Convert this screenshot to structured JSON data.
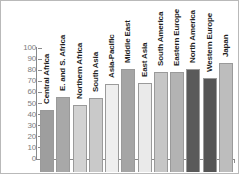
{
  "chart_data": {
    "type": "bar",
    "title": "",
    "subtitle": "",
    "xlabel": "",
    "ylabel": "",
    "ylim": [
      0,
      100
    ],
    "yticks": [
      0,
      10,
      20,
      30,
      40,
      50,
      60,
      70,
      80,
      90,
      100
    ],
    "grid": false,
    "legend": "none",
    "orientation": "vertical",
    "label_rotation": -90,
    "categories": [
      "Central Africa",
      "E. and S. Africa",
      "Northern Africa",
      "South Asia",
      "Asia-Pacific",
      "Middle East",
      "East Asia",
      "South America",
      "Eastern Europe",
      "North America",
      "Western Europe",
      "Japan"
    ],
    "values": [
      56,
      68,
      60,
      67,
      79,
      93,
      80,
      90,
      90,
      93,
      85,
      98
    ],
    "bar_colors": [
      "#9e9e9e",
      "#a8a8a8",
      "#d2d2d2",
      "#c9c9c9",
      "#eeeeee",
      "#a5a5a5",
      "#eaeaea",
      "#c6c6c6",
      "#b3b3b3",
      "#5a5a5a",
      "#555555",
      "#bdbdbd"
    ],
    "axis_color": "#8a8a8a",
    "tick_label_color": "#7c7c7c",
    "bar_border_color": "#9a9a9a",
    "background_color": "#ffffff",
    "frame_color": "#b9b9b9"
  }
}
